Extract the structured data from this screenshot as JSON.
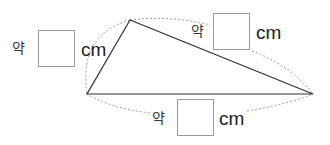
{
  "triangle": {
    "vertices": {
      "top": [
        130,
        20
      ],
      "left": [
        87,
        94
      ],
      "right": [
        313,
        94
      ]
    },
    "stroke_color": "#333333",
    "arc_color": "#9a9a9a"
  },
  "labels": {
    "left_side": {
      "prefix": "약",
      "value": "",
      "unit": "cm"
    },
    "top_side": {
      "prefix": "약",
      "value": "",
      "unit": "cm"
    },
    "bottom_side": {
      "prefix": "약",
      "value": "",
      "unit": "cm"
    }
  }
}
